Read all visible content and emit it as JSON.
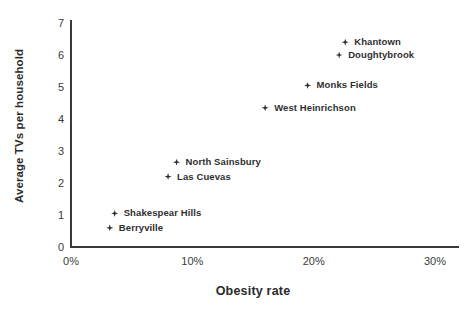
{
  "chart_data": {
    "type": "scatter",
    "title": "",
    "xlabel": "Obesity rate",
    "ylabel": "Average TVs per household",
    "xlim": [
      0,
      30
    ],
    "ylim": [
      0,
      7
    ],
    "grid": false,
    "legend": "none",
    "x_tick_labels": [
      "0%",
      "10%",
      "20%",
      "30%"
    ],
    "x_tick_values": [
      0,
      10,
      20,
      30
    ],
    "y_tick_labels": [
      "0",
      "1",
      "2",
      "3",
      "4",
      "5",
      "6",
      "7"
    ],
    "y_tick_values": [
      0,
      1,
      2,
      3,
      4,
      5,
      6,
      7
    ],
    "points": [
      {
        "label": "Khantown",
        "x": 22.6,
        "y": 6.4
      },
      {
        "label": "Doughtybrook",
        "x": 22.1,
        "y": 6.0
      },
      {
        "label": "Monks Fields",
        "x": 19.5,
        "y": 5.05
      },
      {
        "label": "West Heinrichson",
        "x": 16.0,
        "y": 4.35
      },
      {
        "label": "North Sainsbury",
        "x": 8.7,
        "y": 2.65
      },
      {
        "label": "Las Cuevas",
        "x": 8.0,
        "y": 2.2
      },
      {
        "label": "Shakespear Hills",
        "x": 3.6,
        "y": 1.05
      },
      {
        "label": "Berryville",
        "x": 3.2,
        "y": 0.6
      }
    ],
    "marker_color": "#2f2f2f",
    "axis_color": "#3a3a3a",
    "background_color": "#ffffff"
  }
}
